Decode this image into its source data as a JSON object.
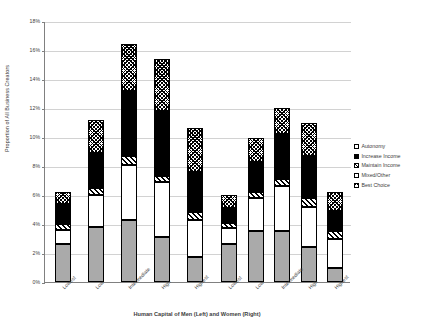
{
  "chart_data": {
    "type": "bar",
    "subtype": "stacked-bar",
    "title": "",
    "xlabel": "Human Capital of Men (Left) and Women (Right)",
    "ylabel": "Proportion of All Business Creators",
    "ylim": [
      0,
      18
    ],
    "y_unit": "%",
    "ytick_labels": [
      "0%",
      "2%",
      "4%",
      "6%",
      "8%",
      "10%",
      "12%",
      "14%",
      "16%",
      "18%"
    ],
    "ytick_values": [
      0,
      2,
      4,
      6,
      8,
      10,
      12,
      14,
      16,
      18
    ],
    "grid": "horizontal",
    "legend_position": "right",
    "groups": [
      "Human Capital of Men (Left)",
      "Human Capital of Women (Right)"
    ],
    "categories": [
      "Lowest",
      "Low",
      "Intermediate",
      "High",
      "Highest",
      "Lowest",
      "Low",
      "Intermediate",
      "High",
      "Highest"
    ],
    "series": [
      {
        "name": "Autonomy",
        "pattern": "solid-gray",
        "values": [
          2.6,
          3.8,
          4.3,
          3.1,
          1.7,
          2.6,
          3.5,
          3.5,
          2.4,
          1.0
        ]
      },
      {
        "name": "Mixed/Other",
        "pattern": "solid-white",
        "values": [
          1.0,
          2.2,
          3.8,
          3.8,
          2.6,
          1.1,
          2.3,
          3.1,
          2.8,
          2.0
        ]
      },
      {
        "name": "Maintain Income",
        "pattern": "hatched",
        "values": [
          0.4,
          0.5,
          0.6,
          0.4,
          0.5,
          0.4,
          0.4,
          0.5,
          0.6,
          0.5
        ]
      },
      {
        "name": "Increase Income",
        "pattern": "solid-black",
        "values": [
          1.4,
          2.4,
          4.5,
          4.5,
          2.8,
          1.0,
          2.1,
          3.1,
          2.9,
          1.4
        ]
      },
      {
        "name": "Best Choice",
        "pattern": "checkered",
        "values": [
          0.8,
          2.3,
          3.2,
          3.6,
          3.0,
          0.9,
          1.6,
          1.8,
          2.3,
          1.3
        ]
      }
    ],
    "totals": [
      6.2,
      11.2,
      16.4,
      15.4,
      10.6,
      6.0,
      9.9,
      12.0,
      11.0,
      6.2
    ]
  },
  "legend": {
    "items": [
      {
        "label": "Autonomy",
        "swatch": "swatch-autonomy-icon"
      },
      {
        "label": "Increase Income",
        "swatch": "swatch-increase-income-icon"
      },
      {
        "label": "Maintain Income",
        "swatch": "swatch-maintain-income-icon"
      },
      {
        "label": "Mixed/Other",
        "swatch": "swatch-mixed-other-icon"
      },
      {
        "label": "Best Choice",
        "swatch": "swatch-best-choice-icon"
      }
    ]
  }
}
